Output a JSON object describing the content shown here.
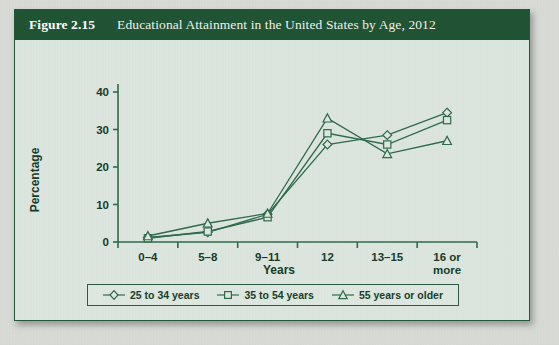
{
  "figure": {
    "number": "Figure 2.15",
    "title": "Educational Attainment in the United States by Age, 2012"
  },
  "colors": {
    "header_bg": "#1f5434",
    "panel_bg": "#dde7e0",
    "line": "#2f6b4a",
    "page_bg": "#d9dbd6"
  },
  "chart_data": {
    "type": "line",
    "title": "Educational Attainment in the United States by Age, 2012",
    "xlabel": "Years",
    "ylabel": "Percentage",
    "categories": [
      "0–4",
      "5–8",
      "9–11",
      "12",
      "13–15",
      "16 or\nmore"
    ],
    "category_labels": [
      {
        "line1": "0–4",
        "line2": ""
      },
      {
        "line1": "5–8",
        "line2": ""
      },
      {
        "line1": "9–11",
        "line2": ""
      },
      {
        "line1": "12",
        "line2": ""
      },
      {
        "line1": "13–15",
        "line2": ""
      },
      {
        "line1": "16 or",
        "line2": "more"
      }
    ],
    "ylim": [
      0,
      40
    ],
    "yticks": [
      0,
      10,
      20,
      30,
      40
    ],
    "ytick_labels": [
      "0",
      "10",
      "20",
      "30",
      "40"
    ],
    "grid": false,
    "legend_position": "bottom",
    "series": [
      {
        "name": "25 to 34 years",
        "marker": "diamond",
        "values": [
          1.2,
          2.6,
          7.4,
          26.0,
          28.5,
          34.5
        ]
      },
      {
        "name": "35 to 54 years",
        "marker": "square",
        "values": [
          1.0,
          2.8,
          6.6,
          29.0,
          26.0,
          32.5
        ]
      },
      {
        "name": "55 years or older",
        "marker": "triangle",
        "values": [
          1.6,
          5.0,
          7.6,
          33.0,
          23.5,
          27.0
        ]
      }
    ]
  },
  "legend": {
    "items": [
      {
        "label": "25 to 34 years",
        "marker": "diamond"
      },
      {
        "label": "35 to 54 years",
        "marker": "square"
      },
      {
        "label": "55 years or older",
        "marker": "triangle"
      }
    ]
  }
}
